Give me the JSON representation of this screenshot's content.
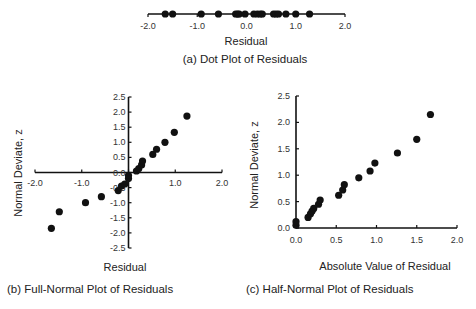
{
  "chart_data": [
    {
      "id": "a",
      "type": "scatter",
      "subtype": "dot-plot",
      "title": "(a) Dot Plot of Residuals",
      "xlabel": "Residual",
      "ylabel": "",
      "xlim": [
        -2.0,
        2.0
      ],
      "xticks": [
        "-2.0",
        "-1.0",
        "0.0",
        "1.0",
        "2.0"
      ],
      "x": [
        -1.65,
        -1.5,
        -0.92,
        -0.57,
        -0.22,
        -0.18,
        -0.15,
        -0.03,
        0.15,
        0.22,
        0.28,
        0.32,
        0.55,
        0.6,
        0.65,
        0.8,
        1.0,
        1.28
      ],
      "grid": false
    },
    {
      "id": "b",
      "type": "scatter",
      "title": "(b) Full-Normal Plot of Residuals",
      "xlabel": "Residual",
      "ylabel": "Normal Deviate, z",
      "xlim": [
        -2.0,
        2.0
      ],
      "ylim": [
        -2.5,
        2.5
      ],
      "xticks": [
        "-2.0",
        "-1.0",
        "0.0",
        "1.0",
        "2.0"
      ],
      "yticks": [
        "2.5",
        "2.0",
        "1.5",
        "1.0",
        "0.5",
        "0.0",
        "-0.5",
        "-1.0",
        "-1.5",
        "-2.0",
        "-2.5"
      ],
      "points": [
        {
          "x": -1.65,
          "y": -1.85
        },
        {
          "x": -1.48,
          "y": -1.3
        },
        {
          "x": -0.92,
          "y": -1.0
        },
        {
          "x": -0.58,
          "y": -0.8
        },
        {
          "x": -0.22,
          "y": -0.6
        },
        {
          "x": -0.15,
          "y": -0.45
        },
        {
          "x": -0.08,
          "y": -0.38
        },
        {
          "x": 0.0,
          "y": -0.2
        },
        {
          "x": 0.0,
          "y": -0.1
        },
        {
          "x": 0.17,
          "y": 0.05
        },
        {
          "x": 0.22,
          "y": 0.13
        },
        {
          "x": 0.28,
          "y": 0.25
        },
        {
          "x": 0.3,
          "y": 0.38
        },
        {
          "x": 0.52,
          "y": 0.6
        },
        {
          "x": 0.6,
          "y": 0.77
        },
        {
          "x": 0.78,
          "y": 1.0
        },
        {
          "x": 0.98,
          "y": 1.33
        },
        {
          "x": 1.25,
          "y": 1.87
        }
      ],
      "grid": false
    },
    {
      "id": "c",
      "type": "scatter",
      "title": "(c) Half-Normal Plot of Residuals",
      "xlabel": "Absolute Value of Residual",
      "ylabel": "Normal Deviate, z",
      "xlim": [
        0.0,
        2.0
      ],
      "ylim": [
        0.0,
        2.5
      ],
      "xticks": [
        "0.0",
        "0.5",
        "1.0",
        "1.5",
        "2.0"
      ],
      "yticks": [
        "2.5",
        "2.0",
        "1.5",
        "1.0",
        "0.5",
        "0.0"
      ],
      "points": [
        {
          "x": 0.0,
          "y": 0.05
        },
        {
          "x": 0.0,
          "y": 0.12
        },
        {
          "x": 0.15,
          "y": 0.2
        },
        {
          "x": 0.18,
          "y": 0.27
        },
        {
          "x": 0.2,
          "y": 0.32
        },
        {
          "x": 0.22,
          "y": 0.37
        },
        {
          "x": 0.28,
          "y": 0.45
        },
        {
          "x": 0.3,
          "y": 0.53
        },
        {
          "x": 0.53,
          "y": 0.62
        },
        {
          "x": 0.58,
          "y": 0.72
        },
        {
          "x": 0.6,
          "y": 0.82
        },
        {
          "x": 0.78,
          "y": 0.95
        },
        {
          "x": 0.92,
          "y": 1.08
        },
        {
          "x": 0.98,
          "y": 1.23
        },
        {
          "x": 1.26,
          "y": 1.42
        },
        {
          "x": 1.5,
          "y": 1.68
        },
        {
          "x": 1.67,
          "y": 2.15
        }
      ],
      "grid": false
    }
  ],
  "colors": {
    "marker": "#111111",
    "axis": "#111111",
    "text": "#222222"
  }
}
